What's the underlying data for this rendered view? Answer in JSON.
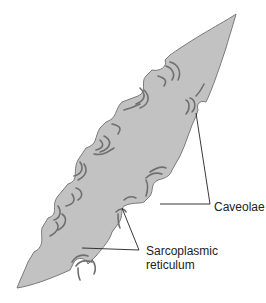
{
  "diagram": {
    "labels": {
      "caveolae": "Caveolae",
      "sr_line1": "Sarcoplasmic",
      "sr_line2": "reticulum"
    },
    "colors": {
      "cell_fill": "#c2c2c2",
      "cell_stroke": "#7a7a7a",
      "leader_line": "#222222",
      "background": "#ffffff"
    },
    "annotations": [
      {
        "label": "Caveolae",
        "points_to": [
          "membrane indentation near upper right edge",
          "membrane indentation mid right edge"
        ]
      },
      {
        "label": "Sarcoplasmic reticulum",
        "points_to": [
          "SR tubules near lower right edge",
          "SR tubules lower middle edge"
        ]
      }
    ]
  }
}
